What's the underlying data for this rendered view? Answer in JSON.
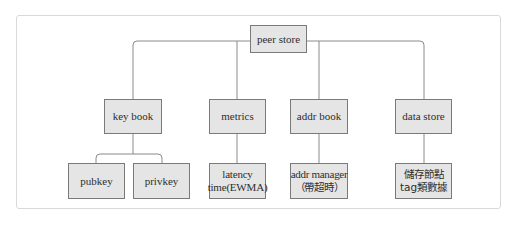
{
  "diagram": {
    "type": "tree",
    "colors": {
      "box_fill": "#e5e5e5",
      "box_border": "#7a7a7a",
      "line": "#8a8a8a",
      "text": "#2e2e2e",
      "frame_border": "#d9d9d9"
    },
    "root": {
      "label": "peer store"
    },
    "children": [
      {
        "label": "key book",
        "children": [
          {
            "lines": [
              "pubkey"
            ]
          },
          {
            "lines": [
              "privkey"
            ]
          }
        ]
      },
      {
        "label": "metrics",
        "children": [
          {
            "lines": [
              "latency",
              "time(EWMA)"
            ]
          }
        ]
      },
      {
        "label": "addr book",
        "children": [
          {
            "lines": [
              "addr manager",
              "（帶超時）"
            ]
          }
        ]
      },
      {
        "label": "data store",
        "children": [
          {
            "lines": [
              "儲存節點",
              "tag類數據"
            ]
          }
        ]
      }
    ]
  }
}
